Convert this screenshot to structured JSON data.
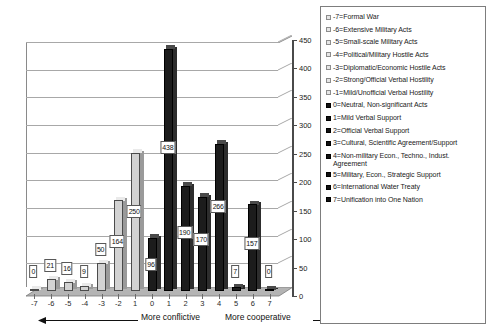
{
  "chart_data": {
    "type": "bar",
    "title": "",
    "subtitle": "",
    "xlabel": "",
    "ylabel": "",
    "ylim": [
      0,
      450
    ],
    "ytick_step": 50,
    "grid": true,
    "legend_position": "right",
    "style": "3d-column",
    "categories": [
      "-7",
      "-6",
      "-5",
      "-4",
      "-3",
      "-2",
      "1",
      "0",
      "1",
      "2",
      "3",
      "4",
      "5",
      "6",
      "7"
    ],
    "category_codes": [
      -7,
      -6,
      -5,
      -4,
      -3,
      -2,
      -1,
      0,
      1,
      2,
      3,
      4,
      5,
      6,
      7
    ],
    "values": [
      0,
      21,
      16,
      9,
      50,
      164,
      250,
      96,
      438,
      190,
      170,
      266,
      7,
      157,
      0
    ],
    "data_labels": [
      "0",
      "21",
      "16",
      "9",
      "50",
      "164",
      "250",
      "96",
      "438",
      "190",
      "170",
      "266",
      "7",
      "157",
      "0"
    ],
    "bar_shades": [
      "light",
      "light",
      "light",
      "light",
      "light",
      "light",
      "light",
      "dark",
      "dark",
      "dark",
      "dark",
      "dark",
      "dark",
      "dark",
      "dark"
    ],
    "ytick_labels": [
      "0",
      "50",
      "100",
      "150",
      "200",
      "250",
      "300",
      "350",
      "400",
      "450"
    ],
    "annotations": [
      {
        "text": "More conflictive",
        "arrow": "left"
      },
      {
        "text": "More cooperative",
        "arrow": "right"
      }
    ],
    "legend_entries": [
      {
        "code": "-7",
        "label": "-7=Formal War",
        "marker": "light",
        "lines": 1
      },
      {
        "code": "-6",
        "label": "-6=Extensive Military Acts",
        "marker": "light",
        "lines": 1
      },
      {
        "code": "-5",
        "label": "-5=Small-scale Military Acts",
        "marker": "light",
        "lines": 1
      },
      {
        "code": "-4",
        "label": "-4=Political/Military Hostile Acts",
        "marker": "light",
        "lines": 1
      },
      {
        "code": "-3",
        "label": "-3=Diplomatic/Economic Hostile Acts",
        "marker": "light",
        "lines": 1
      },
      {
        "code": "-2",
        "label": "-2=Strong/Official Verbal Hostility",
        "marker": "light",
        "lines": 1
      },
      {
        "code": "-1",
        "label": "-1=Mild/Unofficial Verbal Hostility",
        "marker": "light",
        "lines": 1
      },
      {
        "code": "0",
        "label": "0=Neutral, Non-significant Acts",
        "marker": "dark",
        "lines": 1
      },
      {
        "code": "1",
        "label": "1=Mild Verbal Support",
        "marker": "dark",
        "lines": 1
      },
      {
        "code": "2",
        "label": "2=Official Verbal Support",
        "marker": "dark",
        "lines": 1
      },
      {
        "code": "3",
        "label": "3=Cultural, Scientific Agreement/Support",
        "marker": "dark",
        "lines": 1
      },
      {
        "code": "4",
        "label": "4=Non-military Econ., Techno., Indust. Agreement",
        "marker": "dark",
        "lines": 2
      },
      {
        "code": "5",
        "label": "5=Military, Econ., Strategic Support",
        "marker": "dark",
        "lines": 1
      },
      {
        "code": "6",
        "label": "6=International Water Treaty",
        "marker": "dark",
        "lines": 1
      },
      {
        "code": "7",
        "label": "7=Unification into One Nation",
        "marker": "dark",
        "lines": 1
      }
    ]
  },
  "legend": {
    "items": [
      "-7=Formal War",
      "-6=Extensive Military Acts",
      "-5=Small-scale Military Acts",
      "-4=Political/Military Hostile Acts",
      "-3=Diplomatic/Economic Hostile Acts",
      "-2=Strong/Official Verbal Hostility",
      "-1=Mild/Unofficial Verbal Hostility",
      "0=Neutral, Non-significant Acts",
      "1=Mild Verbal Support",
      "2=Official Verbal Support",
      "3=Cultural, Scientific Agreement/Support",
      "4=Non-military Econ., Techno., Indust. Agreement",
      "5=Military, Econ., Strategic Support",
      "6=International Water Treaty",
      "7=Unification into One Nation"
    ]
  },
  "axis": {
    "y_ticks": [
      "450",
      "400",
      "350",
      "300",
      "250",
      "200",
      "150",
      "100",
      "50",
      "0"
    ],
    "x_ticks": [
      "-7",
      "-6",
      "-5",
      "-4",
      "-3",
      "-2",
      "1",
      "0",
      "1",
      "2",
      "3",
      "4",
      "5",
      "6",
      "7"
    ]
  },
  "annotations": {
    "left_text": "More conflictive",
    "right_text": "More cooperative"
  },
  "colors": {
    "bar_light": "#d2d2d2",
    "bar_dark": "#1c1c1c",
    "grid": "#a8a8a8",
    "axis": "#4a4a4a",
    "floor": "#b4b4b4",
    "background": "#ffffff"
  }
}
